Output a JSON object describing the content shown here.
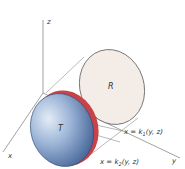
{
  "figure": {
    "axes": {
      "x_label": "x",
      "y_label": "y",
      "z_label": "z"
    },
    "regions": {
      "R_label": "R",
      "T_label": "T"
    },
    "surfaces": {
      "k1": {
        "prefix": "x = k",
        "sub": "1",
        "args": "(y, z)"
      },
      "k2": {
        "prefix": "x = k",
        "sub": "2",
        "args": "(y, z)"
      }
    },
    "colors": {
      "R_fill": "#f4ede7",
      "T_fill_light": "#dbe6f3",
      "T_fill_mid": "#8fa9cf",
      "T_fill_dark": "#3e5f93",
      "rim_red": "#c8424a",
      "axis_line": "#8a8a8a",
      "outline": "#555555"
    }
  }
}
